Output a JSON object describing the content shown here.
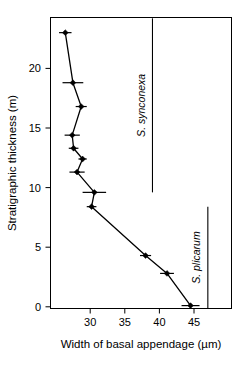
{
  "chart_data": {
    "type": "scatter",
    "title": "",
    "xlabel": "Width of basal appendage (µm)",
    "ylabel": "Stratigraphic thickness (m)",
    "xlim": [
      25.5,
      47.5
    ],
    "ylim": [
      -1.2,
      24.2
    ],
    "xticks": [
      30,
      35,
      40,
      45
    ],
    "xtick_labels": [
      "30",
      "35",
      "40",
      "45"
    ],
    "yticks": [
      0,
      5,
      10,
      15,
      20
    ],
    "ytick_labels": [
      "0",
      "5",
      "10",
      "15",
      "20"
    ],
    "grid": false,
    "legend": false,
    "marker": "filled-diamond",
    "connected": true,
    "error_bars": "horizontal",
    "series": [
      {
        "name": "Width of basal appendage vs stratigraphic thickness",
        "points": [
          {
            "x": 44.5,
            "y": 0.1,
            "xerr": 1.3
          },
          {
            "x": 41.1,
            "y": 2.8,
            "xerr": 1.0
          },
          {
            "x": 38.0,
            "y": 4.3,
            "xerr": 0.8
          },
          {
            "x": 30.2,
            "y": 8.4,
            "xerr": 0.7
          },
          {
            "x": 30.6,
            "y": 9.6,
            "xerr": 1.7
          },
          {
            "x": 28.1,
            "y": 11.3,
            "xerr": 1.1
          },
          {
            "x": 28.9,
            "y": 12.4,
            "xerr": 0.6
          },
          {
            "x": 27.6,
            "y": 13.3,
            "xerr": 0.7
          },
          {
            "x": 27.4,
            "y": 14.4,
            "xerr": 1.1
          },
          {
            "x": 28.7,
            "y": 16.8,
            "xerr": 0.8
          },
          {
            "x": 27.5,
            "y": 18.8,
            "xerr": 1.5
          },
          {
            "x": 26.4,
            "y": 23.0,
            "xerr": 0.9
          }
        ]
      }
    ],
    "annotations": [
      {
        "id": "synconexa-range",
        "label": "S. synconexa",
        "orientation": "vertical",
        "x": 39.0,
        "y_top": 24.2,
        "y_bottom": 9.6
      },
      {
        "id": "plicarum-range",
        "label": "S. plicarum",
        "orientation": "vertical",
        "x": 47.0,
        "y_top": 8.4,
        "y_bottom": -0.4
      }
    ]
  },
  "colors": {
    "background": "#ffffff",
    "foreground": "#000000",
    "axis": "#000000",
    "marker": "#000000"
  }
}
